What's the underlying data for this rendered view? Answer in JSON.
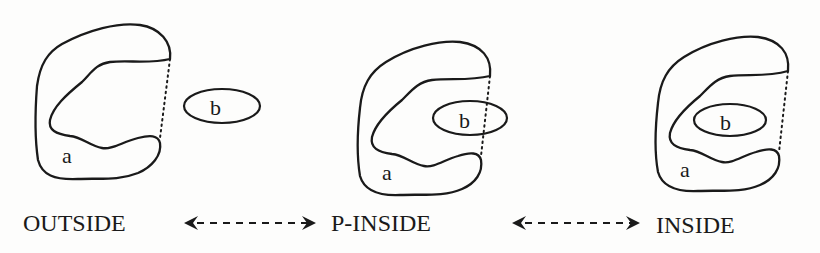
{
  "figure": {
    "panels": [
      {
        "id": "outside",
        "state_label": "OUTSIDE",
        "region_a_label": "a",
        "region_b_label": "b"
      },
      {
        "id": "p-inside",
        "state_label": "P-INSIDE",
        "region_a_label": "a",
        "region_b_label": "b"
      },
      {
        "id": "inside",
        "state_label": "INSIDE",
        "region_a_label": "a",
        "region_b_label": "b"
      }
    ],
    "transitions": [
      {
        "from": "OUTSIDE",
        "to": "P-INSIDE",
        "style": "dashed-bidirectional"
      },
      {
        "from": "P-INSIDE",
        "to": "INSIDE",
        "style": "dashed-bidirectional"
      }
    ],
    "colors": {
      "ink": "#1a1a1a",
      "paper": "#fdfdfc"
    }
  }
}
